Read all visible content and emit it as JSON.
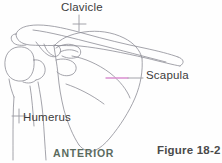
{
  "figure": {
    "caption": "Figure 18-2",
    "orientation_label": "ANTERIOR",
    "background_color": "#fefefe",
    "line_color": "#8a8a92",
    "label_color": "#3c3c3c",
    "orientation_color": "#5b6b5e",
    "caption_color": "#4a4a4a",
    "leader_highlight_color": "#d98fd0"
  },
  "labels": {
    "clavicle": "Clavicle",
    "scapula": "Scapula",
    "humerus": "Humerus"
  },
  "annotations": [
    {
      "name": "clavicle",
      "text": "Clavicle",
      "leader_type": "vertical-tick-cross",
      "points_to": "clavicle-shaft"
    },
    {
      "name": "scapula",
      "text": "Scapula",
      "leader_type": "horizontal-line",
      "leader_color": "#d98fd0",
      "points_to": "scapula-body"
    },
    {
      "name": "humerus",
      "text": "Humerus",
      "leader_type": "cross-tick",
      "points_to": "humeral-shaft"
    }
  ]
}
